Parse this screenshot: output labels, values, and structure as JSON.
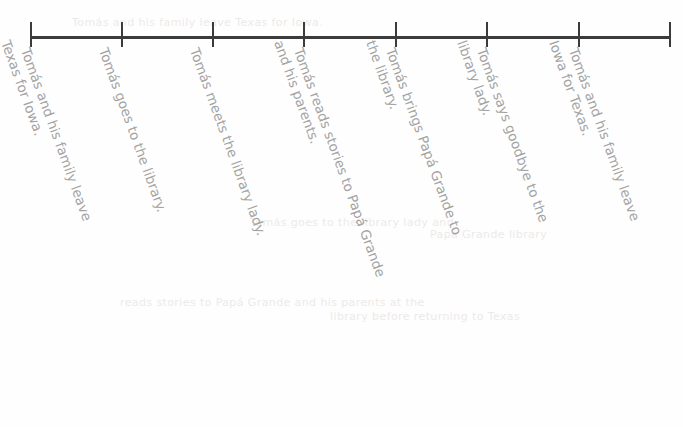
{
  "document": {
    "type": "timeline",
    "title": "Story events timeline",
    "axis": {
      "color": "#3b3b3b",
      "start_x": 30,
      "end_x": 671,
      "y": 36,
      "tick_count": 8,
      "tick_positions": [
        30,
        121,
        212,
        303,
        395,
        486,
        578,
        669
      ]
    },
    "label_color": "#a3a3a3",
    "label_rotation_deg": 70
  },
  "events": [
    {
      "index": 1,
      "anchor_x": 30,
      "line1": "Tomás and his family leave",
      "line2": "Texas for Iowa."
    },
    {
      "index": 2,
      "anchor_x": 121,
      "line1": "Tomás goes to the library.",
      "line2": ""
    },
    {
      "index": 3,
      "anchor_x": 212,
      "line1": "Tomás meets the library lady.",
      "line2": ""
    },
    {
      "index": 4,
      "anchor_x": 303,
      "line1": "Tomás reads stories to Papá Grande",
      "line2": "and his parents."
    },
    {
      "index": 5,
      "anchor_x": 395,
      "line1": "Tomás brings Papá Grande to",
      "line2": "the library."
    },
    {
      "index": 6,
      "anchor_x": 486,
      "line1": "Tomás says goodbye to the",
      "line2": "library lady."
    },
    {
      "index": 7,
      "anchor_x": 578,
      "line1": "Tomás and his family leave",
      "line2": "Iowa for Texas."
    }
  ],
  "ghosts": [
    {
      "x": 72,
      "y": 16,
      "text": "Tomás and his family leave Texas for Iowa."
    },
    {
      "x": 250,
      "y": 216,
      "text": "Tomás  goes  to  the  library  lady  and"
    },
    {
      "x": 120,
      "y": 296,
      "text": "reads  stories  to  Papá  Grande  and  his  parents  at  the"
    },
    {
      "x": 330,
      "y": 310,
      "text": "library  before  returning  to  Texas"
    },
    {
      "x": 430,
      "y": 228,
      "text": "Papá  Grande  library"
    }
  ]
}
